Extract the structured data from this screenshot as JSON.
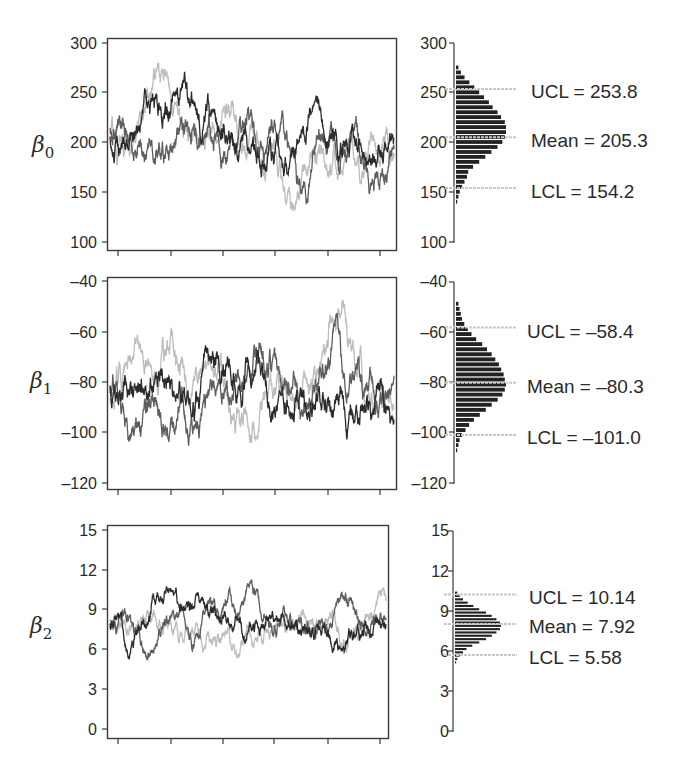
{
  "chart_data": [
    {
      "type": "line",
      "panel": "trace",
      "parameter": "β0",
      "ylabel": "β0",
      "yticks": [
        300,
        250,
        200,
        150,
        100
      ],
      "ylim": [
        100,
        300
      ],
      "xlabel": "",
      "xticks_count": 6,
      "xtick_labels": [],
      "series": [
        {
          "name": "chain-1",
          "color": "#2b2b2b"
        },
        {
          "name": "chain-2",
          "color": "#5e5e5e"
        },
        {
          "name": "chain-3",
          "color": "#bdbdbd"
        }
      ],
      "approx_range": {
        "min": 118,
        "max": 285
      },
      "grid": false
    },
    {
      "type": "bar",
      "panel": "histogram",
      "parameter": "β0",
      "orientation": "horizontal",
      "yticks": [
        300,
        250,
        200,
        150,
        100
      ],
      "ylim": [
        100,
        300
      ],
      "annotations": [
        {
          "label": "UCL",
          "value": 253.8,
          "text": "UCL = 253.8"
        },
        {
          "label": "Mean",
          "value": 205.3,
          "text": "Mean = 205.3"
        },
        {
          "label": "LCL",
          "value": 154.2,
          "text": "LCL = 154.2"
        }
      ],
      "bins": {
        "start": 138,
        "width": 5,
        "counts": [
          1,
          2,
          3,
          5,
          7,
          9,
          10,
          14,
          19,
          24,
          29,
          34,
          38,
          40,
          41,
          41,
          40,
          37,
          34,
          30,
          27,
          23,
          19,
          15,
          11,
          7,
          4,
          2
        ]
      }
    },
    {
      "type": "line",
      "panel": "trace",
      "parameter": "β1",
      "ylabel": "β1",
      "yticks": [
        -40,
        -60,
        -80,
        -100,
        -120
      ],
      "ylim": [
        -120,
        -40
      ],
      "xlabel": "",
      "xticks_count": 6,
      "xtick_labels": [],
      "series": [
        {
          "name": "chain-1",
          "color": "#2b2b2b"
        },
        {
          "name": "chain-2",
          "color": "#5e5e5e"
        },
        {
          "name": "chain-3",
          "color": "#bdbdbd"
        }
      ],
      "approx_range": {
        "min": -113,
        "max": -45
      },
      "grid": false
    },
    {
      "type": "bar",
      "panel": "histogram",
      "parameter": "β1",
      "orientation": "horizontal",
      "yticks": [
        -40,
        -60,
        -80,
        -100,
        -120
      ],
      "ylim": [
        -120,
        -40
      ],
      "annotations": [
        {
          "label": "UCL",
          "value": -58.4,
          "text": "UCL = –58.4"
        },
        {
          "label": "Mean",
          "value": -80.3,
          "text": "Mean = –80.3"
        },
        {
          "label": "LCL",
          "value": -101.0,
          "text": "LCL = –101.0"
        }
      ],
      "bins": {
        "start": -108,
        "width": 2,
        "counts": [
          1,
          2,
          3,
          5,
          8,
          11,
          15,
          20,
          25,
          30,
          35,
          39,
          41,
          42,
          41,
          40,
          38,
          36,
          33,
          30,
          26,
          22,
          17,
          13,
          10,
          7,
          5,
          4,
          3,
          2
        ]
      }
    },
    {
      "type": "line",
      "panel": "trace",
      "parameter": "β2",
      "ylabel": "β2",
      "yticks": [
        15,
        12,
        9,
        6,
        3,
        0
      ],
      "ylim": [
        0,
        15
      ],
      "xlabel": "",
      "xticks_count": 6,
      "xtick_labels": [],
      "series": [
        {
          "name": "chain-1",
          "color": "#2b2b2b"
        },
        {
          "name": "chain-2",
          "color": "#5e5e5e"
        },
        {
          "name": "chain-3",
          "color": "#bdbdbd"
        }
      ],
      "approx_range": {
        "min": 4.0,
        "max": 11.4
      },
      "grid": false
    },
    {
      "type": "bar",
      "panel": "histogram",
      "parameter": "β2",
      "orientation": "horizontal",
      "yticks": [
        15,
        12,
        9,
        6,
        3,
        0
      ],
      "ylim": [
        0,
        15
      ],
      "annotations": [
        {
          "label": "UCL",
          "value": 10.14,
          "text": "UCL = 10.14"
        },
        {
          "label": "Mean",
          "value": 7.92,
          "text": "Mean = 7.92"
        },
        {
          "label": "LCL",
          "value": 5.58,
          "text": "LCL = 5.58"
        }
      ],
      "bins": {
        "start": 4.9,
        "width": 0.25,
        "counts": [
          1,
          2,
          4,
          7,
          10,
          15,
          21,
          27,
          32,
          36,
          39,
          40,
          39,
          36,
          32,
          27,
          21,
          16,
          11,
          7,
          4,
          2
        ]
      }
    }
  ],
  "panels": [
    {
      "param_symbol": "β",
      "param_sub": "0",
      "trace_ticks": [
        "300",
        "250",
        "200",
        "150",
        "100"
      ],
      "hist_ticks": [
        "300",
        "250",
        "200",
        "150",
        "100"
      ],
      "ucl_text": "UCL = 253.8",
      "mean_text": "Mean = 205.3",
      "lcl_text": "LCL = 154.2"
    },
    {
      "param_symbol": "β",
      "param_sub": "1",
      "trace_ticks": [
        "–40",
        "–60",
        "–80",
        "–100",
        "–120"
      ],
      "hist_ticks": [
        "–40",
        "–60",
        "–80",
        "–100",
        "–120"
      ],
      "ucl_text": "UCL = –58.4",
      "mean_text": "Mean = –80.3",
      "lcl_text": "LCL = –101.0"
    },
    {
      "param_symbol": "β",
      "param_sub": "2",
      "trace_ticks": [
        "15",
        "12",
        "9",
        "6",
        "3",
        "0"
      ],
      "hist_ticks": [
        "15",
        "12",
        "9",
        "6",
        "3",
        "0"
      ],
      "ucl_text": "UCL = 10.14",
      "mean_text": "Mean = 7.92",
      "lcl_text": "LCL = 5.58"
    }
  ],
  "colors": {
    "axis": "#3a3a3a",
    "chain_dark": "#2b2b2b",
    "chain_mid": "#5e5e5e",
    "chain_light": "#bdbdbd",
    "histogram_bar": "#222222",
    "reference_line": "#c8c8c8"
  }
}
